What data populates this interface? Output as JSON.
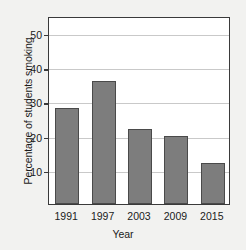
{
  "chart_data": {
    "type": "bar",
    "title": "",
    "subtitle": "",
    "xlabel": "Year",
    "ylabel": "Percentage of students smoking",
    "categories": [
      "1991",
      "1997",
      "2003",
      "2009",
      "2015"
    ],
    "values": [
      28,
      36,
      22,
      20,
      12
    ],
    "series": [
      {
        "name": "Percentage of students smoking",
        "values": [
          28,
          36,
          22,
          20,
          12
        ]
      }
    ],
    "ylim": [
      0,
      55
    ],
    "yticks": [
      10,
      20,
      30,
      40,
      50
    ],
    "ytick_labels": [
      "10",
      "20",
      "30",
      "40",
      "50"
    ],
    "xtick_labels": [
      "1991",
      "1997",
      "2003",
      "2009",
      "2015"
    ],
    "grid": true,
    "grid_axis": "y",
    "legend": false,
    "legend_position": "none",
    "annotations": [],
    "colors": {
      "bar_fill": "#7d7d7d",
      "bar_edge": "#4a4a4a",
      "plot_background": "#ffffff",
      "figure_background": "#f2f2f0",
      "gridline": "#c9c9c9",
      "axis": "#3a3a3a",
      "text": "#1b1b1b"
    }
  }
}
